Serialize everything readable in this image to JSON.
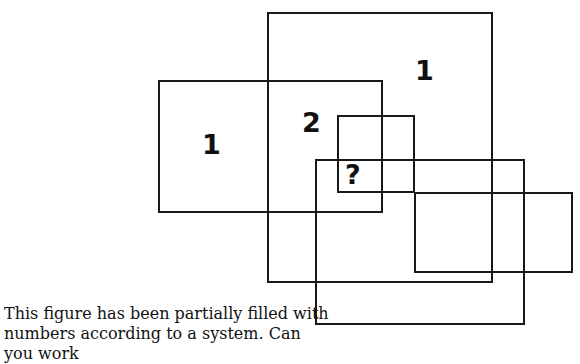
{
  "puzzle": {
    "rectangles": [
      {
        "id": "big-top",
        "x": 267,
        "y": 12,
        "w": 226,
        "h": 271
      },
      {
        "id": "left",
        "x": 158,
        "y": 80,
        "w": 225,
        "h": 133
      },
      {
        "id": "small",
        "x": 337,
        "y": 115,
        "w": 78,
        "h": 78
      },
      {
        "id": "lower",
        "x": 315,
        "y": 159,
        "w": 210,
        "h": 166
      },
      {
        "id": "right",
        "x": 414,
        "y": 192,
        "w": 159,
        "h": 81
      }
    ],
    "labels": [
      {
        "id": "label-left",
        "text": "1",
        "x": 202,
        "y": 131
      },
      {
        "id": "label-top",
        "text": "1",
        "x": 415,
        "y": 57
      },
      {
        "id": "label-mid",
        "text": "2",
        "x": 302,
        "y": 109
      },
      {
        "id": "label-question",
        "text": "?",
        "x": 345,
        "y": 161
      }
    ],
    "caption_line1": "This figure has been partially filled with",
    "caption_line2": "numbers according to a system. Can you work"
  }
}
